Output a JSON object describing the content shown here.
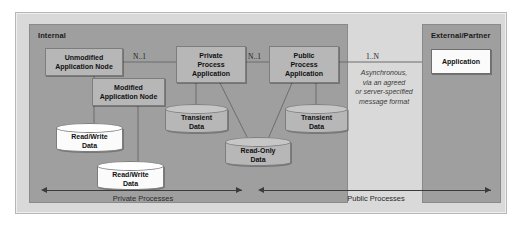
{
  "diagram": {
    "zones": {
      "internal_label": "Internal",
      "external_label": "External/Partner"
    },
    "nodes": {
      "unmodified_application_node": "Unmodified\nApplication Node",
      "unmodified_line1": "Unmodified",
      "unmodified_line2": "Application Node",
      "modified_line1": "Modified",
      "modified_line2": "Application Node",
      "private_line1": "Private",
      "private_line2": "Process",
      "private_line3": "Application",
      "public_line1": "Public",
      "public_line2": "Process",
      "public_line3": "Application",
      "external_application": "Application"
    },
    "datastores": {
      "read_write_1_line1": "Read/Write",
      "read_write_1_line2": "Data",
      "read_write_2_line1": "Read/Write",
      "read_write_2_line2": "Data",
      "transient_1_line1": "Transient",
      "transient_1_line2": "Data",
      "transient_2_line1": "Transient",
      "transient_2_line2": "Data",
      "read_only_line1": "Read-Only",
      "read_only_line2": "Data"
    },
    "multiplicities": {
      "unmodified_to_private": "N..1",
      "private_to_public": "N..1",
      "public_to_external": "1..N"
    },
    "annotation": {
      "line1": "Asynchronous,",
      "line2": "via an agreed",
      "line3": "or server-specified",
      "line4": "message format"
    },
    "spans": {
      "private_processes": "Private Processes",
      "public_processes": "Public Processes"
    },
    "colors": {
      "page_background": "#ffffff",
      "frame_background": "#d9d9d9",
      "zone_background": "#9f9f9f",
      "node_fill": "#b7b7b7",
      "highlight_fill": "#fbfbfb",
      "line": "#6d6d6d",
      "arrow": "#3b3b3b",
      "text": "#111111"
    }
  }
}
